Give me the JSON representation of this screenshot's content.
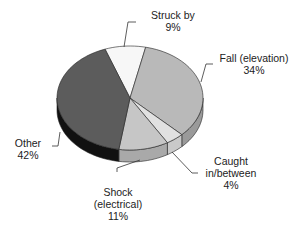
{
  "chart_data": {
    "type": "pie",
    "title": "",
    "style": "3d-pie",
    "categories": [
      "Struck by",
      "Fall (elevation)",
      "Caught in/between",
      "Shock (electrical)",
      "Other"
    ],
    "values": [
      9,
      34,
      4,
      11,
      42
    ],
    "unit": "%",
    "colors": [
      "#f7f7f7",
      "#b9b9b9",
      "#e1e1e1",
      "#c6c6c6",
      "#5c5c5c"
    ],
    "side_colors": [
      "#d9d9d9",
      "#9a9a9a",
      "#c9c9c9",
      "#a9a9a9",
      "#111111"
    ],
    "start_angle_deg": -110,
    "legend": "none (callout labels)"
  },
  "labels": [
    {
      "line1": "Struck by",
      "line2": "9%",
      "line3": ""
    },
    {
      "line1": "Fall (elevation)",
      "line2": "34%",
      "line3": ""
    },
    {
      "line1": "Caught",
      "line2": "in/between",
      "line3": "4%"
    },
    {
      "line1": "Shock",
      "line2": "(electrical)",
      "line3": "11%"
    },
    {
      "line1": "Other",
      "line2": "42%",
      "line3": ""
    }
  ]
}
